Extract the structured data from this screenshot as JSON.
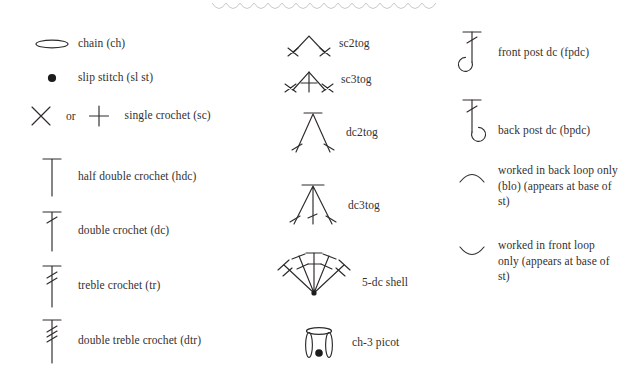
{
  "page": {
    "ink_color": "#2e2b2b",
    "background_color": "#ffffff",
    "scallop_color": "#c9c9cf"
  },
  "columns": [
    {
      "name": "basic-stitches",
      "entries": [
        {
          "symbol": "chain-oval-icon",
          "label": "chain (ch)"
        },
        {
          "symbol": "slip-stitch-dot-icon",
          "label": "slip stitch (sl st)"
        },
        {
          "symbol": "single-crochet-x-icon",
          "alt_symbol": "single-crochet-plus-icon",
          "connector": "or",
          "label": "single crochet (sc)"
        },
        {
          "symbol": "half-double-crochet-icon",
          "label": "half double crochet (hdc)"
        },
        {
          "symbol": "double-crochet-icon",
          "label": "double crochet (dc)"
        },
        {
          "symbol": "treble-crochet-icon",
          "label": "treble crochet (tr)"
        },
        {
          "symbol": "double-treble-crochet-icon",
          "label": "double treble crochet (dtr)"
        }
      ]
    },
    {
      "name": "decreases-and-clusters",
      "entries": [
        {
          "symbol": "sc2tog-icon",
          "label": "sc2tog"
        },
        {
          "symbol": "sc3tog-icon",
          "label": "sc3tog"
        },
        {
          "symbol": "dc2tog-icon",
          "label": "dc2tog"
        },
        {
          "symbol": "dc3tog-icon",
          "label": "dc3tog"
        },
        {
          "symbol": "five-dc-shell-icon",
          "label": "5-dc shell"
        },
        {
          "symbol": "ch3-picot-icon",
          "label": "ch-3 picot"
        }
      ]
    },
    {
      "name": "post-stitches-and-loops",
      "entries": [
        {
          "symbol": "front-post-dc-icon",
          "label": "front post dc (fpdc)"
        },
        {
          "symbol": "back-post-dc-icon",
          "label": "back post dc (bpdc)"
        },
        {
          "symbol": "back-loop-only-icon",
          "label": "worked in back loop only (blo) (appears at base of st)"
        },
        {
          "symbol": "front-loop-only-icon",
          "label": "worked in front loop only (appears at base of st)"
        }
      ]
    }
  ]
}
